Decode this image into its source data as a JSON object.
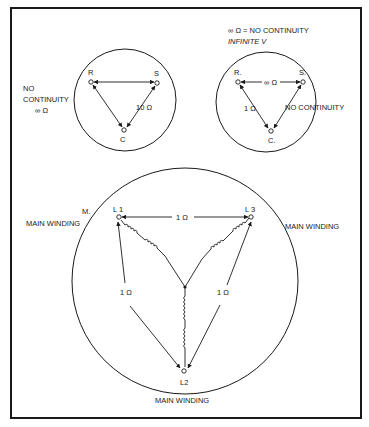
{
  "diagram": {
    "frame": {
      "stroke": "#1a1a1a"
    },
    "top_left": {
      "nodes": {
        "R": "R",
        "S": "S",
        "C": "C"
      },
      "label_rc_side": "",
      "label_sc": "10 Ω",
      "side_note": [
        "NO",
        "CONTINUITY",
        "∞ Ω"
      ]
    },
    "top_right": {
      "header": [
        "∞ Ω = NO CONTINUITY",
        "INFINITE  V"
      ],
      "nodes": {
        "R": "R.",
        "S": "S.",
        "C": "C."
      },
      "label_rs": "∞ Ω",
      "label_rc": "1 Ω",
      "label_sc": "NO CONTINUITY"
    },
    "bottom": {
      "nodes": {
        "L1": "L 1",
        "L3": "L 3",
        "L2": "L2"
      },
      "label_l1_l3": "1 Ω",
      "label_l1_l2": "1 Ω",
      "label_l3_l2": "1 Ω",
      "label_m": "M.",
      "label_left": "MAIN WINDING",
      "label_right": "MAIN WINDING",
      "label_bottom": "MAIN WINDING"
    }
  }
}
